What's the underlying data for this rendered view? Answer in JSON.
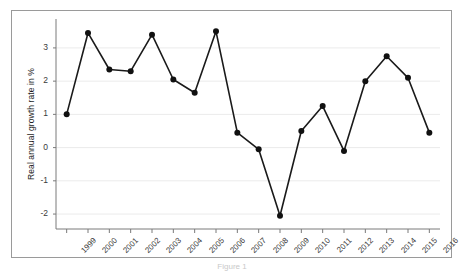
{
  "figure": {
    "background_color": "#ffffff",
    "frame_color": "#9a9a9a",
    "caption_partial": "Figure 1"
  },
  "chart_data": {
    "type": "line",
    "title": "",
    "subtitle": "",
    "xlabel": "",
    "ylabel": "Real annual growth rate in %",
    "x": [
      1999,
      2000,
      2001,
      2002,
      2003,
      2004,
      2005,
      2006,
      2007,
      2008,
      2009,
      2010,
      2011,
      2012,
      2013,
      2014,
      2015,
      2016
    ],
    "categories": [
      "1999",
      "2000",
      "2001",
      "2002",
      "2003",
      "2004",
      "2005",
      "2006",
      "2007",
      "2008",
      "2009",
      "2010",
      "2011",
      "2012",
      "2013",
      "2014",
      "2015",
      "2016"
    ],
    "values": [
      1.0,
      3.45,
      2.35,
      2.3,
      3.4,
      2.05,
      1.65,
      3.5,
      0.45,
      -0.05,
      -2.05,
      0.5,
      1.25,
      -0.1,
      2.0,
      2.75,
      2.1,
      0.45
    ],
    "series": [
      {
        "name": "Real annual growth rate",
        "values": [
          1.0,
          3.45,
          2.35,
          2.3,
          3.4,
          2.05,
          1.65,
          3.5,
          0.45,
          -0.05,
          -2.05,
          0.5,
          1.25,
          -0.1,
          2.0,
          2.75,
          2.1,
          0.45
        ],
        "color": "#1a1a1a",
        "marker": "circle"
      }
    ],
    "ylim": [
      -2.45,
      3.75
    ],
    "xlim": [
      1998.4,
      2016.6
    ],
    "yticks": [
      3,
      2,
      1,
      0,
      -1,
      -2
    ],
    "ytick_labels": [
      "3",
      "2",
      "1",
      "0",
      "-1",
      "-2"
    ],
    "xtick_labels": [
      "1999",
      "2000",
      "2001",
      "2002",
      "2003",
      "2004",
      "2005",
      "2006",
      "2007",
      "2008",
      "2009",
      "2010",
      "2011",
      "2012",
      "2013",
      "2014",
      "2015",
      "2016"
    ],
    "grid": true,
    "grid_axis": "y",
    "grid_color": "#ebebeb",
    "legend": false,
    "legend_position": "none",
    "line_color": "#1a1a1a",
    "marker_color": "#111111",
    "axis_color": "#7a7a7a"
  }
}
